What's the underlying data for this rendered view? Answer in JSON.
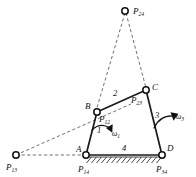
{
  "diagram": {
    "background_color": "#ffffff",
    "line_color": "#1a1a1a",
    "dashed_color": "#55555a",
    "joint_fill": "#ffffff",
    "points": [
      {
        "id": "P24",
        "label_base": "P",
        "label_sub": "24",
        "x": 125,
        "y": 11,
        "kind": "instant-center"
      },
      {
        "id": "C",
        "label_base": "C",
        "label_sub": "",
        "x": 146,
        "y": 90,
        "kind": "pin-joint"
      },
      {
        "id": "P23",
        "label_base": "P",
        "label_sub": "23",
        "x": 146,
        "y": 90,
        "kind": "instant-center-label"
      },
      {
        "id": "B",
        "label_base": "B",
        "label_sub": "",
        "x": 97,
        "y": 112,
        "kind": "pin-joint"
      },
      {
        "id": "P12",
        "label_base": "P",
        "label_sub": "12",
        "x": 97,
        "y": 112,
        "kind": "instant-center-label"
      },
      {
        "id": "A",
        "label_base": "A",
        "label_sub": "",
        "x": 86,
        "y": 155,
        "kind": "pin-joint"
      },
      {
        "id": "P14",
        "label_base": "P",
        "label_sub": "14",
        "x": 86,
        "y": 155,
        "kind": "instant-center-label"
      },
      {
        "id": "D",
        "label_base": "D",
        "label_sub": "",
        "x": 162,
        "y": 155,
        "kind": "pin-joint"
      },
      {
        "id": "P34",
        "label_base": "P",
        "label_sub": "34",
        "x": 162,
        "y": 155,
        "kind": "instant-center-label"
      },
      {
        "id": "P13",
        "label_base": "P",
        "label_sub": "13",
        "x": 16,
        "y": 155,
        "kind": "instant-center"
      }
    ],
    "point_labels": {
      "P24": {
        "base": "P",
        "sub": "24"
      },
      "P13": {
        "base": "P",
        "sub": "13"
      },
      "P12": {
        "base": "P",
        "sub": "12"
      },
      "P23": {
        "base": "P",
        "sub": "23"
      },
      "P14": {
        "base": "P",
        "sub": "14"
      },
      "P34": {
        "base": "P",
        "sub": "34"
      },
      "A": "A",
      "B": "B",
      "C": "C",
      "D": "D"
    },
    "links": [
      {
        "id": "link1",
        "label": "1",
        "from": "A",
        "to": "B",
        "style": "solid"
      },
      {
        "id": "link2",
        "label": "2",
        "from": "B",
        "to": "C",
        "style": "solid"
      },
      {
        "id": "link3",
        "label": "3",
        "from": "C",
        "to": "D",
        "style": "solid"
      },
      {
        "id": "link4",
        "label": "4",
        "from": "A",
        "to": "D",
        "style": "ground"
      }
    ],
    "link_labels": {
      "link1": "1",
      "link2": "2",
      "link3": "3",
      "link4": "4"
    },
    "construction_lines": [
      {
        "id": "P13-to-B",
        "from": "P13",
        "to": "B",
        "style": "dashed",
        "extended": true
      },
      {
        "id": "P13-to-A",
        "from": "P13",
        "to": "A",
        "style": "dashed"
      },
      {
        "id": "P24-to-B",
        "from": "P24",
        "to": "B",
        "style": "dashed"
      },
      {
        "id": "P24-to-C",
        "from": "P24",
        "to": "C",
        "style": "dashed"
      }
    ],
    "angular_velocities": [
      {
        "id": "omega1",
        "base": "ω",
        "sub": "1",
        "link": "1",
        "direction": "clockwise",
        "x": 110,
        "y": 133
      },
      {
        "id": "omega3",
        "base": "ω",
        "sub": "3",
        "link": "3",
        "direction": "clockwise",
        "x": 176,
        "y": 118
      }
    ],
    "omega_labels": {
      "omega1": {
        "base": "ω",
        "sub": "1"
      },
      "omega3": {
        "base": "ω",
        "sub": "3"
      }
    },
    "ground": {
      "id": "ground-hatching",
      "from_x": 86,
      "to_x": 162,
      "y": 157,
      "hatch_count": 15,
      "description": "fixed-frame hatching"
    }
  }
}
